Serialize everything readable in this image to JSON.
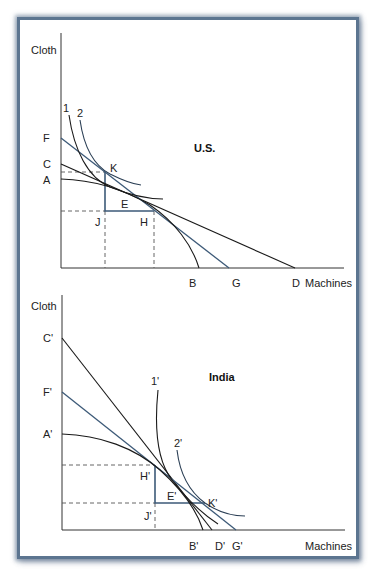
{
  "colors": {
    "frame_border": "#5c7590",
    "axis": "#333333",
    "black_curve": "#1a1a1a",
    "blue_line": "#3d5a78",
    "dashed": "#555555"
  },
  "us_panel": {
    "title": "U.S.",
    "y_axis_label": "Cloth",
    "x_axis_label": "Machines",
    "y_intercept_labels": [
      "F",
      "C",
      "A"
    ],
    "x_intercept_labels": [
      "B",
      "G",
      "D"
    ],
    "curve_labels": [
      "1",
      "2"
    ],
    "point_labels": {
      "K": "K",
      "E": "E",
      "J": "J",
      "H": "H"
    },
    "lines": [
      {
        "name": "FG",
        "color": "blue",
        "from": "F",
        "to": "G"
      },
      {
        "name": "CD",
        "color": "black",
        "from": "C",
        "to": "D"
      }
    ],
    "production_frontier": "AB",
    "indifference_curves": [
      "1",
      "2"
    ],
    "trade_triangle": [
      "K",
      "J",
      "H"
    ]
  },
  "india_panel": {
    "title": "India",
    "y_axis_label": "Cloth",
    "x_axis_label": "Machines",
    "y_intercept_labels": [
      "C'",
      "F'",
      "A'"
    ],
    "x_intercept_labels": [
      "B'",
      "D'",
      "G'"
    ],
    "curve_labels": [
      "1'",
      "2'"
    ],
    "point_labels": {
      "H": "H'",
      "E": "E'",
      "J": "J'",
      "K": "K'"
    },
    "lines": [
      {
        "name": "C'D'",
        "color": "black",
        "from": "C'",
        "to": "D'"
      },
      {
        "name": "F'G'",
        "color": "blue",
        "from": "F'",
        "to": "G'"
      }
    ],
    "production_frontier": "A'B'",
    "indifference_curves": [
      "1'",
      "2'"
    ],
    "trade_triangle": [
      "H'",
      "J'",
      "K'"
    ]
  }
}
